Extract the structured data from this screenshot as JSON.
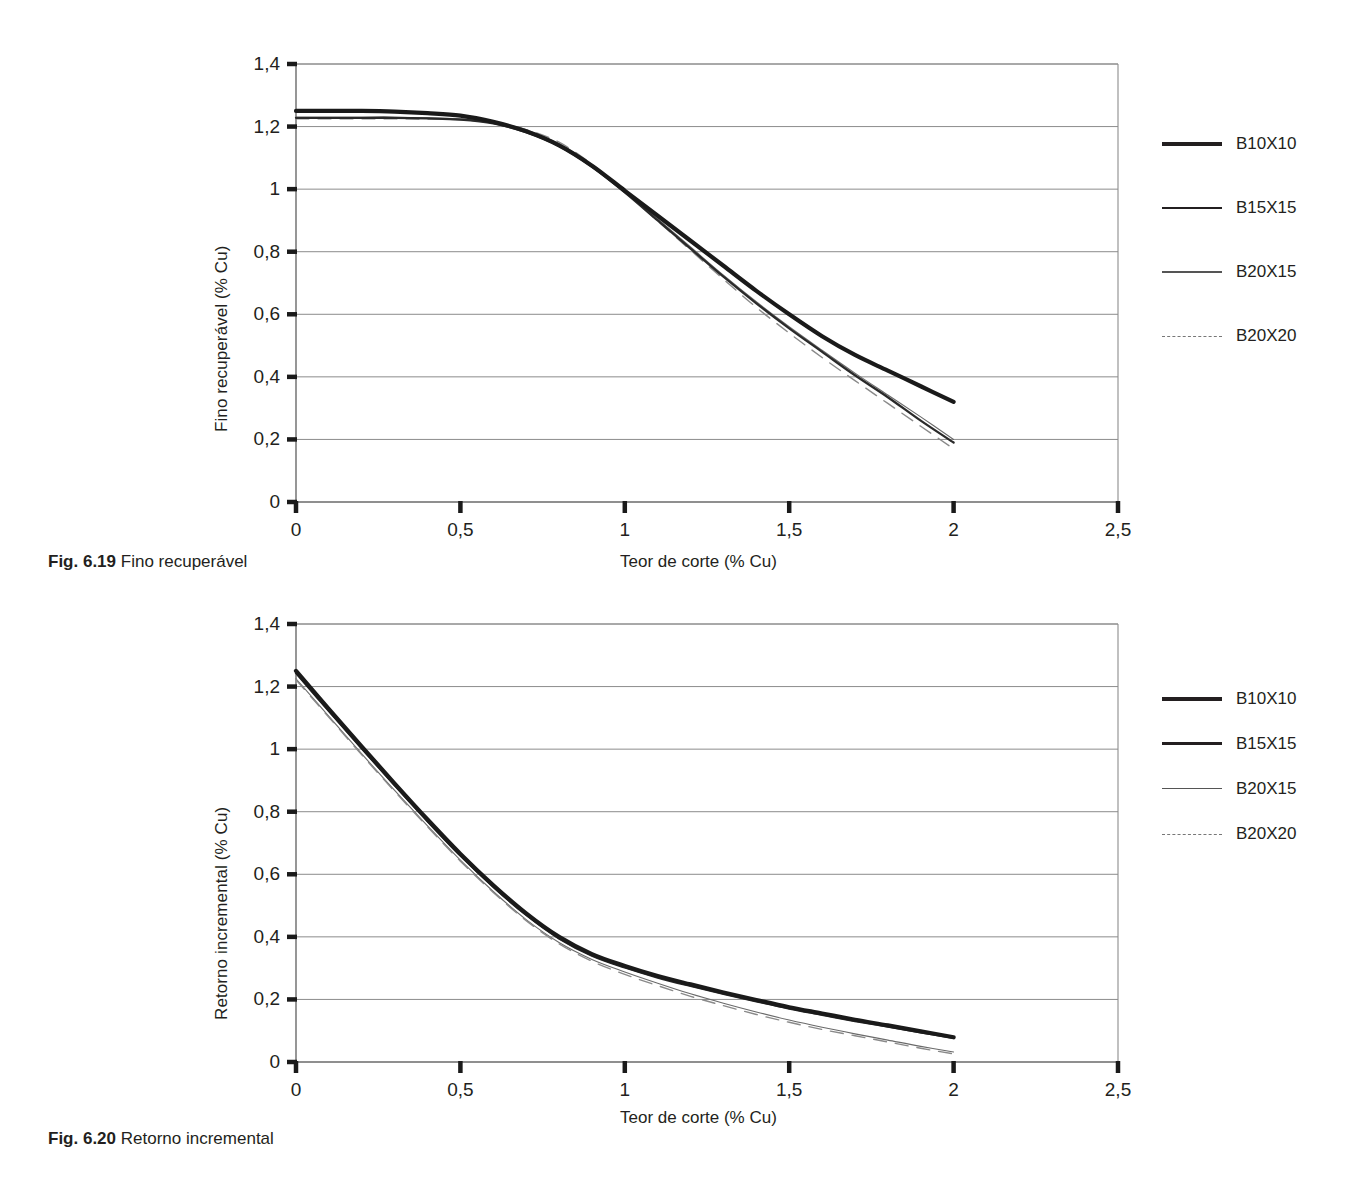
{
  "figures": [
    {
      "caption_prefix": "Fig. 6.19",
      "caption_text": "Fino recuperável",
      "legend": [
        {
          "label": "B10X10",
          "style": "thick"
        },
        {
          "label": "B15X15",
          "style": "medium"
        },
        {
          "label": "B20X15",
          "style": "thin"
        },
        {
          "label": "B20X20",
          "style": "dashed"
        }
      ]
    },
    {
      "caption_prefix": "Fig. 6.20",
      "caption_text": "Retorno incremental",
      "legend": [
        {
          "label": "B10X10",
          "style": "thick"
        },
        {
          "label": "B15X15",
          "style": "medium"
        },
        {
          "label": "B20X15",
          "style": "thin"
        },
        {
          "label": "B20X20",
          "style": "dashed"
        }
      ]
    }
  ],
  "chart_data": [
    {
      "type": "line",
      "title": "Fino recuperável",
      "xlabel": "Teor de corte (% Cu)",
      "ylabel": "Fino recuperável (% Cu)",
      "xlim": [
        0,
        2.5
      ],
      "ylim": [
        0,
        1.4
      ],
      "xticks": [
        0,
        0.5,
        1,
        1.5,
        2,
        2.5
      ],
      "xticklabels": [
        "0",
        "0,5",
        "1",
        "1,5",
        "2",
        "2,5"
      ],
      "yticks": [
        0,
        0.2,
        0.4,
        0.6,
        0.8,
        1,
        1.2,
        1.4
      ],
      "yticklabels": [
        "0",
        "0,2",
        "0,4",
        "0,6",
        "0,8",
        "1",
        "1,2",
        "1,4"
      ],
      "grid": "horizontal",
      "legend_position": "right",
      "x": [
        0,
        0.1,
        0.2,
        0.3,
        0.4,
        0.5,
        0.6,
        0.7,
        0.8,
        0.9,
        1.0,
        1.1,
        1.2,
        1.3,
        1.4,
        1.5,
        1.6,
        1.7,
        1.8,
        1.9,
        2.0
      ],
      "series": [
        {
          "name": "B10X10",
          "style": "thick",
          "values": [
            1.25,
            1.25,
            1.25,
            1.248,
            1.243,
            1.235,
            1.215,
            1.185,
            1.14,
            1.075,
            0.995,
            0.915,
            0.835,
            0.755,
            0.675,
            0.6,
            0.53,
            0.47,
            0.42,
            0.37,
            0.32
          ]
        },
        {
          "name": "B15X15",
          "style": "medium",
          "values": [
            1.228,
            1.228,
            1.228,
            1.228,
            1.226,
            1.222,
            1.21,
            1.182,
            1.138,
            1.072,
            0.99,
            0.9,
            0.81,
            0.72,
            0.635,
            0.555,
            0.48,
            0.405,
            0.335,
            0.26,
            0.19
          ]
        },
        {
          "name": "B20X15",
          "style": "thin",
          "values": [
            1.23,
            1.23,
            1.23,
            1.23,
            1.228,
            1.225,
            1.215,
            1.19,
            1.145,
            1.078,
            0.995,
            0.905,
            0.815,
            0.725,
            0.64,
            0.56,
            0.485,
            0.412,
            0.342,
            0.272,
            0.2
          ]
        },
        {
          "name": "B20X20",
          "style": "dashed",
          "values": [
            1.225,
            1.225,
            1.225,
            1.225,
            1.224,
            1.222,
            1.212,
            1.19,
            1.15,
            1.08,
            0.992,
            0.898,
            0.805,
            0.712,
            0.622,
            0.54,
            0.462,
            0.388,
            0.315,
            0.242,
            0.17
          ]
        }
      ]
    },
    {
      "type": "line",
      "title": "Retorno incremental",
      "xlabel": "Teor de corte (% Cu)",
      "ylabel": "Retorno incremental (% Cu)",
      "xlim": [
        0,
        2.5
      ],
      "ylim": [
        0,
        1.4
      ],
      "xticks": [
        0,
        0.5,
        1,
        1.5,
        2,
        2.5
      ],
      "xticklabels": [
        "0",
        "0,5",
        "1",
        "1,5",
        "2",
        "2,5"
      ],
      "yticks": [
        0,
        0.2,
        0.4,
        0.6,
        0.8,
        1,
        1.2,
        1.4
      ],
      "yticklabels": [
        "0",
        "0,2",
        "0,4",
        "0,6",
        "0,8",
        "1",
        "1,2",
        "1,4"
      ],
      "grid": "horizontal",
      "legend_position": "right",
      "x": [
        0,
        0.1,
        0.2,
        0.3,
        0.4,
        0.5,
        0.6,
        0.7,
        0.8,
        0.9,
        1.0,
        1.1,
        1.2,
        1.3,
        1.4,
        1.5,
        1.6,
        1.7,
        1.8,
        1.9,
        2.0
      ],
      "series": [
        {
          "name": "B10X10",
          "style": "thick",
          "values": [
            1.25,
            1.128,
            1.008,
            0.89,
            0.775,
            0.665,
            0.565,
            0.475,
            0.4,
            0.345,
            0.307,
            0.275,
            0.248,
            0.222,
            0.198,
            0.175,
            0.155,
            0.135,
            0.117,
            0.098,
            0.079
          ]
        },
        {
          "name": "B15X15",
          "style": "medium",
          "values": [
            1.243,
            1.122,
            1.002,
            0.885,
            0.77,
            0.66,
            0.56,
            0.47,
            0.395,
            0.34,
            0.302,
            0.27,
            0.243,
            0.218,
            0.194,
            0.171,
            0.151,
            0.131,
            0.113,
            0.095,
            0.077
          ]
        },
        {
          "name": "B20X15",
          "style": "thin",
          "values": [
            1.225,
            1.105,
            0.985,
            0.868,
            0.755,
            0.645,
            0.545,
            0.455,
            0.382,
            0.328,
            0.288,
            0.252,
            0.218,
            0.188,
            0.16,
            0.134,
            0.111,
            0.09,
            0.07,
            0.05,
            0.032
          ]
        },
        {
          "name": "B20X20",
          "style": "dashed",
          "values": [
            1.222,
            1.102,
            0.982,
            0.865,
            0.752,
            0.642,
            0.542,
            0.452,
            0.378,
            0.322,
            0.28,
            0.244,
            0.21,
            0.18,
            0.152,
            0.127,
            0.104,
            0.084,
            0.064,
            0.044,
            0.026
          ]
        }
      ]
    }
  ]
}
